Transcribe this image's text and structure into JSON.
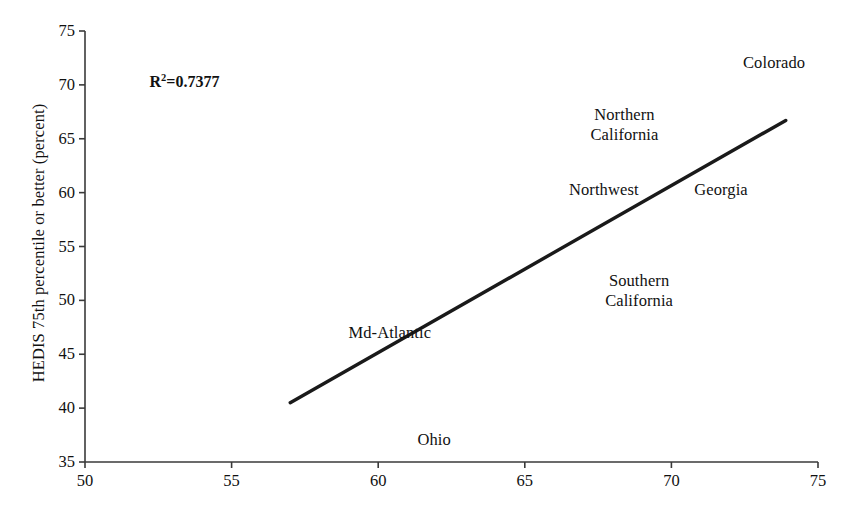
{
  "chart_data": {
    "type": "scatter",
    "title": "",
    "subtitle": "",
    "xlabel": "",
    "ylabel": "HEDIS 75th percentile or better (percent)",
    "xlim": [
      50,
      75
    ],
    "ylim": [
      35,
      75
    ],
    "xticks": [
      50,
      55,
      60,
      65,
      70,
      75
    ],
    "yticks": [
      35,
      40,
      45,
      50,
      55,
      60,
      65,
      70,
      75
    ],
    "grid": false,
    "legend": "none",
    "annotations": [
      {
        "id": "r-squared",
        "text_prefix": "R",
        "text_sup": "2",
        "text_suffix": "=0.7377",
        "full_text": "R2=0.7377",
        "value": 0.7377,
        "x": 52.2,
        "y": 70.3
      }
    ],
    "point_labels": [
      {
        "name": "Colorado",
        "lines": [
          "Colorado"
        ],
        "x": 73.5,
        "y": 72.0
      },
      {
        "name": "Northern California",
        "lines": [
          "Northern",
          "California"
        ],
        "x": 68.4,
        "y": 66.3
      },
      {
        "name": "Northwest",
        "lines": [
          "Northwest"
        ],
        "x": 67.7,
        "y": 60.2
      },
      {
        "name": "Georgia",
        "lines": [
          "Georgia"
        ],
        "x": 71.7,
        "y": 60.2
      },
      {
        "name": "Southern California",
        "lines": [
          "Southern",
          "California"
        ],
        "x": 68.9,
        "y": 50.9
      },
      {
        "name": "Md-Atlantic",
        "lines": [
          "Md-Atlantic"
        ],
        "x": 60.4,
        "y": 47.0
      },
      {
        "name": "Ohio",
        "lines": [
          "Ohio"
        ],
        "x": 61.9,
        "y": 37.0
      }
    ],
    "trendline": {
      "name": "regression-line",
      "x0": 57.0,
      "y0": 40.5,
      "x1": 73.9,
      "y1": 66.7,
      "color": "#1a1a1a",
      "width": 3.4
    },
    "axis_color": "#3a3a3a",
    "text_color": "#111111",
    "background": "#ffffff"
  },
  "labels": {
    "y_axis_title": "HEDIS 75th percentile or better (percent)",
    "yticks": [
      "35",
      "40",
      "45",
      "50",
      "55",
      "60",
      "65",
      "70",
      "75"
    ],
    "xticks": [
      "50",
      "55",
      "60",
      "65",
      "70",
      "75"
    ],
    "r2_prefix": "R",
    "r2_sup": "2",
    "r2_suffix": "=0.7377",
    "colorado": "Colorado",
    "northern_1": "Northern",
    "northern_2": "California",
    "northwest": "Northwest",
    "georgia": "Georgia",
    "southern_1": "Southern",
    "southern_2": "California",
    "md_atlantic": "Md-Atlantic",
    "ohio": "Ohio"
  }
}
